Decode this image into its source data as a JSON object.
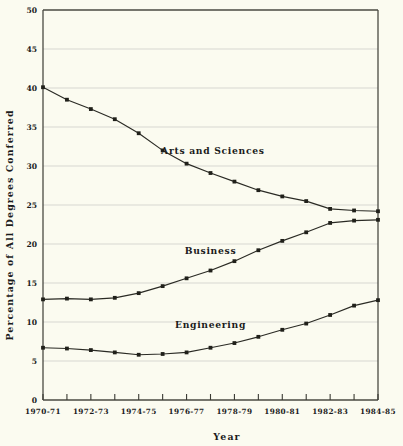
{
  "chart_data": {
    "type": "line",
    "title": "",
    "xlabel": "Year",
    "ylabel": "Percentage of All Degrees Conferred",
    "ylim": [
      0,
      50
    ],
    "ytick_values": [
      0,
      5,
      10,
      15,
      20,
      25,
      30,
      35,
      40,
      45,
      50
    ],
    "ytick_labels": [
      "0",
      "5",
      "10",
      "15",
      "20",
      "25",
      "30",
      "35",
      "40",
      "45",
      "50"
    ],
    "grid": true,
    "legend_position": "inline-annotations",
    "x": [
      "1970-71",
      "1971-72",
      "1972-73",
      "1973-74",
      "1974-75",
      "1975-76",
      "1976-77",
      "1977-78",
      "1978-79",
      "1979-80",
      "1980-81",
      "1981-82",
      "1982-83",
      "1983-84",
      "1984-85"
    ],
    "xtick_labels_shown": [
      "1970-71",
      "1972-73",
      "1974-75",
      "1976-77",
      "1978-79",
      "1980-81",
      "1982-83",
      "1984-85"
    ],
    "series": [
      {
        "name": "Arts and Sciences",
        "label": "Arts and Sciences",
        "color": "#20201a",
        "values": [
          40.1,
          38.5,
          37.3,
          36.0,
          34.2,
          32.0,
          30.3,
          29.1,
          28.0,
          26.9,
          26.1,
          25.5,
          24.5,
          24.3,
          24.2
        ]
      },
      {
        "name": "Business",
        "label": "Business",
        "color": "#20201a",
        "values": [
          12.9,
          13.0,
          12.9,
          13.1,
          13.7,
          14.6,
          15.6,
          16.6,
          17.8,
          19.2,
          20.4,
          21.5,
          22.7,
          23.0,
          23.1
        ]
      },
      {
        "name": "Engineering",
        "label": "Engineering",
        "color": "#20201a",
        "values": [
          6.7,
          6.6,
          6.4,
          6.1,
          5.8,
          5.9,
          6.1,
          6.7,
          7.3,
          8.1,
          9.0,
          9.8,
          10.9,
          12.1,
          12.8
        ]
      }
    ],
    "annotations": [
      {
        "text": "Arts and Sciences",
        "x_index": 7.1,
        "y_value": 31.6
      },
      {
        "text": "Business",
        "x_index": 7.0,
        "y_value": 18.7
      },
      {
        "text": "Engineering",
        "x_index": 7.0,
        "y_value": 9.2
      }
    ]
  },
  "style": {
    "background": "#fbfbf0",
    "grid_color": "#c9c9c4",
    "frame_color": "#4a4a42",
    "ink_color": "#20201a"
  }
}
